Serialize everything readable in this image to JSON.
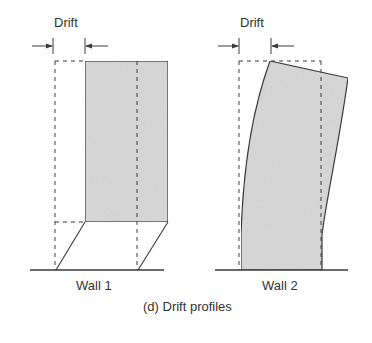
{
  "labels": {
    "drift_1": "Drift",
    "drift_2": "Drift",
    "wall_1": "Wall 1",
    "wall_2": "Wall 2",
    "caption": "(d) Drift profiles"
  },
  "colors": {
    "fill": "#d9d9d9",
    "stroke": "#3a3a3a",
    "text": "#333333"
  }
}
